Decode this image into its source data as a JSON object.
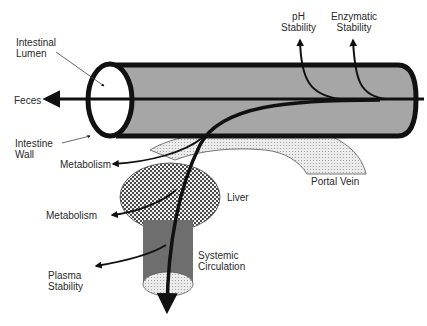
{
  "diagram": {
    "type": "oral drug absorption pathway",
    "colors": {
      "intestine_fill": "#a6a6a6",
      "outline": "#111111",
      "portal_vein_fill": "#e4e4e4",
      "liver_fill": "#8a8a8a",
      "systemic_fill": "#6e6e6e",
      "systemic_bottom_fill": "#e6e6e6"
    },
    "labels": {
      "intestinal_lumen": [
        "Intestinal",
        "Lumen"
      ],
      "ph_stability": [
        "pH",
        "Stability"
      ],
      "enzymatic_stability": [
        "Enzymatic",
        "Stability"
      ],
      "feces": "Feces",
      "intestine_wall": [
        "Intestine",
        "Wall"
      ],
      "metabolism_gut": "Metabolism",
      "portal_vein": "Portal Vein",
      "liver": "Liver",
      "metabolism_liver": "Metabolism",
      "systemic_circulation": [
        "Systemic",
        "Circulation"
      ],
      "plasma_stability": [
        "Plasma",
        "Stability"
      ]
    }
  }
}
